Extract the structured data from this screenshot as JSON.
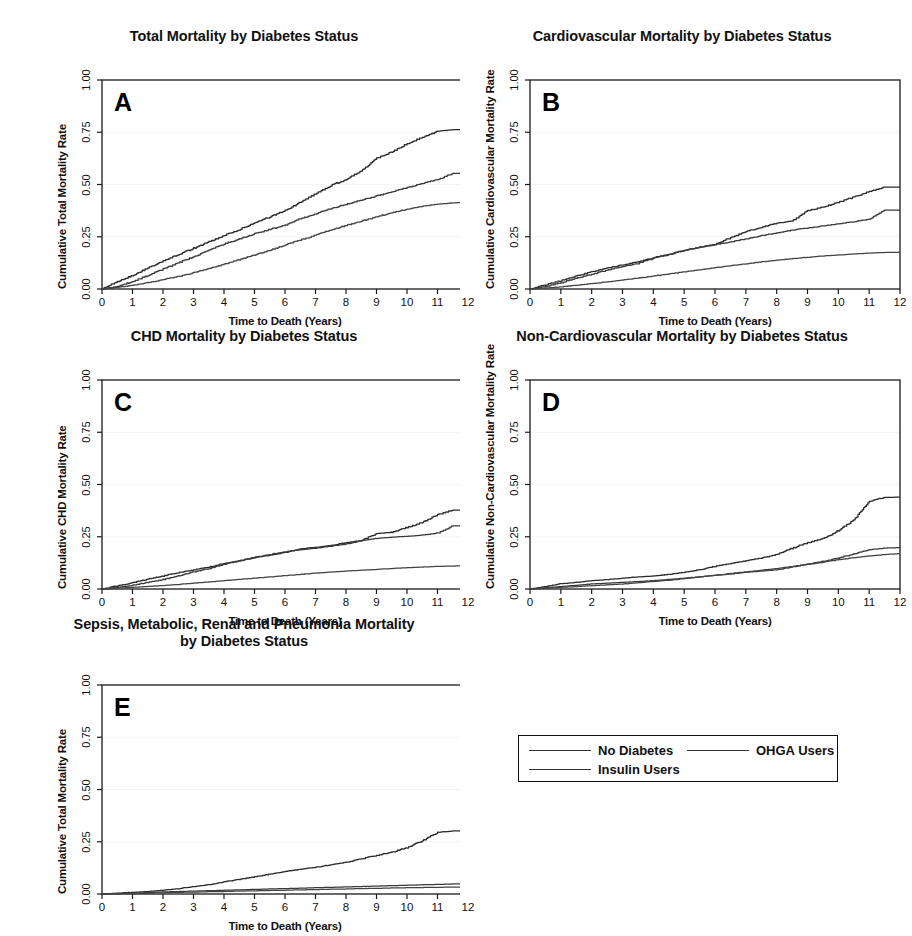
{
  "figure": {
    "legend": {
      "entries": [
        {
          "label": "No Diabetes",
          "key": "no_diabetes"
        },
        {
          "label": "OHGA Users",
          "key": "ohga"
        },
        {
          "label": "Insulin Users",
          "key": "insulin"
        }
      ]
    },
    "common": {
      "xlabel": "Time to Death (Years)",
      "xticks": [
        "0",
        "1",
        "2",
        "3",
        "4",
        "5",
        "6",
        "7",
        "8",
        "9",
        "10",
        "11",
        "12"
      ],
      "yticks": [
        "0.00",
        "0.25",
        "0.50",
        "0.75",
        "1.00"
      ]
    }
  },
  "chart_data": [
    {
      "id": "A",
      "type": "line",
      "title": "Total Mortality by Diabetes Status",
      "panel_letter": "A",
      "xlabel": "Time to Death (Years)",
      "ylabel": "Cumulative Total Mortality Rate",
      "xlim": [
        0,
        12
      ],
      "ylim": [
        0,
        1.0
      ],
      "xticks": [
        0,
        1,
        2,
        3,
        4,
        5,
        6,
        7,
        8,
        9,
        10,
        11,
        12
      ],
      "yticks": [
        0.0,
        0.25,
        0.5,
        0.75,
        1.0
      ],
      "grid": false,
      "legend_position": "external-below",
      "x": [
        0,
        0.5,
        1,
        1.5,
        2,
        2.5,
        3,
        3.5,
        4,
        4.5,
        5,
        5.5,
        6,
        6.5,
        7,
        7.5,
        8,
        8.5,
        9,
        9.5,
        10,
        10.5,
        11,
        11.5,
        12
      ],
      "series": [
        {
          "name": "Insulin Users",
          "values": [
            0,
            0.035,
            0.065,
            0.1,
            0.135,
            0.165,
            0.195,
            0.225,
            0.255,
            0.285,
            0.315,
            0.345,
            0.375,
            0.415,
            0.455,
            0.495,
            0.525,
            0.565,
            0.625,
            0.655,
            0.695,
            0.725,
            0.755,
            0.762,
            0.762
          ]
        },
        {
          "name": "OHGA Users",
          "values": [
            0,
            0.012,
            0.035,
            0.065,
            0.095,
            0.125,
            0.155,
            0.185,
            0.215,
            0.24,
            0.265,
            0.285,
            0.305,
            0.335,
            0.36,
            0.385,
            0.405,
            0.425,
            0.445,
            0.465,
            0.485,
            0.505,
            0.525,
            0.553,
            0.553
          ]
        },
        {
          "name": "No Diabetes",
          "values": [
            0,
            0.008,
            0.018,
            0.03,
            0.045,
            0.06,
            0.078,
            0.098,
            0.118,
            0.14,
            0.163,
            0.185,
            0.21,
            0.235,
            0.258,
            0.282,
            0.305,
            0.325,
            0.345,
            0.365,
            0.382,
            0.396,
            0.406,
            0.412,
            0.415
          ]
        }
      ]
    },
    {
      "id": "B",
      "type": "line",
      "title": "Cardiovascular Mortality by Diabetes Status",
      "panel_letter": "B",
      "xlabel": "Time to Death (Years)",
      "ylabel": "Cumulative Cardiovascular Mortality Rate",
      "xlim": [
        0,
        12
      ],
      "ylim": [
        0,
        1.0
      ],
      "xticks": [
        0,
        1,
        2,
        3,
        4,
        5,
        6,
        7,
        8,
        9,
        10,
        11,
        12
      ],
      "yticks": [
        0.0,
        0.25,
        0.5,
        0.75,
        1.0
      ],
      "grid": false,
      "legend_position": "external-below",
      "x": [
        0,
        0.5,
        1,
        1.5,
        2,
        2.5,
        3,
        3.5,
        4,
        4.5,
        5,
        5.5,
        6,
        6.5,
        7,
        7.5,
        8,
        8.5,
        9,
        9.5,
        10,
        10.5,
        11,
        11.5,
        12
      ],
      "series": [
        {
          "name": "Insulin Users",
          "values": [
            0,
            0.02,
            0.04,
            0.062,
            0.082,
            0.1,
            0.115,
            0.13,
            0.15,
            0.165,
            0.185,
            0.2,
            0.215,
            0.245,
            0.275,
            0.295,
            0.315,
            0.325,
            0.375,
            0.392,
            0.415,
            0.44,
            0.465,
            0.487,
            0.488
          ]
        },
        {
          "name": "OHGA Users",
          "values": [
            0,
            0.012,
            0.03,
            0.052,
            0.07,
            0.09,
            0.108,
            0.122,
            0.148,
            0.165,
            0.185,
            0.2,
            0.212,
            0.225,
            0.24,
            0.255,
            0.268,
            0.282,
            0.292,
            0.302,
            0.312,
            0.322,
            0.335,
            0.378,
            0.378
          ]
        },
        {
          "name": "No Diabetes",
          "values": [
            0,
            0.005,
            0.01,
            0.018,
            0.026,
            0.034,
            0.043,
            0.052,
            0.062,
            0.072,
            0.082,
            0.092,
            0.102,
            0.112,
            0.12,
            0.13,
            0.138,
            0.145,
            0.152,
            0.158,
            0.163,
            0.168,
            0.172,
            0.175,
            0.176
          ]
        }
      ]
    },
    {
      "id": "C",
      "type": "line",
      "title": "CHD Mortality by Diabetes Status",
      "panel_letter": "C",
      "xlabel": "Time to Death (Years)",
      "ylabel": "Cumulative CHD Mortality Rate",
      "xlim": [
        0,
        12
      ],
      "ylim": [
        0,
        1.0
      ],
      "xticks": [
        0,
        1,
        2,
        3,
        4,
        5,
        6,
        7,
        8,
        9,
        10,
        11,
        12
      ],
      "yticks": [
        0.0,
        0.25,
        0.5,
        0.75,
        1.0
      ],
      "grid": false,
      "legend_position": "external-below",
      "x": [
        0,
        0.5,
        1,
        1.5,
        2,
        2.5,
        3,
        3.5,
        4,
        4.5,
        5,
        5.5,
        6,
        6.5,
        7,
        7.5,
        8,
        8.5,
        9,
        9.5,
        10,
        10.5,
        11,
        11.5,
        12
      ],
      "series": [
        {
          "name": "Insulin Users",
          "values": [
            0,
            0.015,
            0.03,
            0.048,
            0.062,
            0.078,
            0.092,
            0.105,
            0.122,
            0.135,
            0.15,
            0.162,
            0.175,
            0.192,
            0.2,
            0.208,
            0.222,
            0.232,
            0.265,
            0.272,
            0.295,
            0.318,
            0.355,
            0.378,
            0.378
          ]
        },
        {
          "name": "OHGA Users",
          "values": [
            0,
            0.008,
            0.018,
            0.032,
            0.045,
            0.062,
            0.082,
            0.098,
            0.118,
            0.135,
            0.152,
            0.165,
            0.178,
            0.188,
            0.195,
            0.205,
            0.215,
            0.232,
            0.242,
            0.248,
            0.252,
            0.258,
            0.268,
            0.302,
            0.302
          ]
        },
        {
          "name": "No Diabetes",
          "values": [
            0,
            0.004,
            0.008,
            0.012,
            0.017,
            0.022,
            0.028,
            0.034,
            0.04,
            0.046,
            0.052,
            0.058,
            0.064,
            0.07,
            0.076,
            0.081,
            0.086,
            0.09,
            0.094,
            0.098,
            0.102,
            0.105,
            0.108,
            0.11,
            0.111
          ]
        }
      ]
    },
    {
      "id": "D",
      "type": "line",
      "title": "Non-Cardiovascular Mortality by Diabetes Status",
      "panel_letter": "D",
      "xlabel": "Time to Death (Years)",
      "ylabel": "Cumulative Non-Cardiovascular Mortality Rate",
      "xlim": [
        0,
        12
      ],
      "ylim": [
        0,
        1.0
      ],
      "xticks": [
        0,
        1,
        2,
        3,
        4,
        5,
        6,
        7,
        8,
        9,
        10,
        11,
        12
      ],
      "yticks": [
        0.0,
        0.25,
        0.5,
        0.75,
        1.0
      ],
      "grid": false,
      "legend_position": "external-below",
      "x": [
        0,
        0.5,
        1,
        1.5,
        2,
        2.5,
        3,
        3.5,
        4,
        4.5,
        5,
        5.5,
        6,
        6.5,
        7,
        7.5,
        8,
        8.5,
        9,
        9.5,
        10,
        10.5,
        11,
        11.5,
        12
      ],
      "series": [
        {
          "name": "Insulin Users",
          "values": [
            0,
            0.012,
            0.025,
            0.032,
            0.04,
            0.045,
            0.052,
            0.058,
            0.062,
            0.07,
            0.08,
            0.092,
            0.108,
            0.122,
            0.135,
            0.148,
            0.165,
            0.195,
            0.222,
            0.24,
            0.28,
            0.33,
            0.42,
            0.438,
            0.44
          ]
        },
        {
          "name": "OHGA Users",
          "values": [
            0,
            0.006,
            0.012,
            0.018,
            0.024,
            0.028,
            0.032,
            0.036,
            0.04,
            0.046,
            0.052,
            0.058,
            0.066,
            0.072,
            0.08,
            0.086,
            0.092,
            0.105,
            0.12,
            0.132,
            0.148,
            0.168,
            0.188,
            0.196,
            0.198
          ]
        },
        {
          "name": "No Diabetes",
          "values": [
            0,
            0.004,
            0.008,
            0.012,
            0.016,
            0.02,
            0.024,
            0.03,
            0.036,
            0.042,
            0.05,
            0.058,
            0.066,
            0.074,
            0.082,
            0.09,
            0.098,
            0.108,
            0.118,
            0.128,
            0.14,
            0.15,
            0.158,
            0.165,
            0.17
          ]
        }
      ]
    },
    {
      "id": "E",
      "type": "line",
      "title": "Sepsis, Metabolic, Renal and Pneumonia Mortality by Diabetes Status",
      "title_line1": "Sepsis, Metabolic, Renal and Pneumonia Mortality",
      "title_line2": "by Diabetes Status",
      "panel_letter": "E",
      "xlabel": "Time to Death (Years)",
      "ylabel": "Cumulative Total Mortality Rate",
      "xlim": [
        0,
        12
      ],
      "ylim": [
        0,
        1.0
      ],
      "xticks": [
        0,
        1,
        2,
        3,
        4,
        5,
        6,
        7,
        8,
        9,
        10,
        11,
        12
      ],
      "yticks": [
        0.0,
        0.25,
        0.5,
        0.75,
        1.0
      ],
      "grid": false,
      "legend_position": "external-right",
      "x": [
        0,
        0.5,
        1,
        1.5,
        2,
        2.5,
        3,
        3.5,
        4,
        4.5,
        5,
        5.5,
        6,
        6.5,
        7,
        7.5,
        8,
        8.5,
        9,
        9.5,
        10,
        10.5,
        11,
        11.5,
        12
      ],
      "series": [
        {
          "name": "Insulin Users",
          "values": [
            0,
            0.004,
            0.008,
            0.012,
            0.018,
            0.026,
            0.035,
            0.045,
            0.058,
            0.07,
            0.082,
            0.095,
            0.108,
            0.118,
            0.128,
            0.14,
            0.152,
            0.168,
            0.185,
            0.2,
            0.222,
            0.255,
            0.295,
            0.302,
            0.302
          ]
        },
        {
          "name": "OHGA Users",
          "values": [
            0,
            0.002,
            0.004,
            0.007,
            0.01,
            0.012,
            0.014,
            0.016,
            0.018,
            0.02,
            0.022,
            0.024,
            0.026,
            0.028,
            0.03,
            0.032,
            0.034,
            0.036,
            0.038,
            0.04,
            0.042,
            0.044,
            0.046,
            0.048,
            0.048
          ]
        },
        {
          "name": "No Diabetes",
          "values": [
            0,
            0.001,
            0.002,
            0.004,
            0.006,
            0.008,
            0.009,
            0.011,
            0.012,
            0.014,
            0.015,
            0.017,
            0.018,
            0.02,
            0.021,
            0.023,
            0.024,
            0.026,
            0.027,
            0.029,
            0.03,
            0.031,
            0.032,
            0.033,
            0.034
          ]
        }
      ]
    }
  ]
}
